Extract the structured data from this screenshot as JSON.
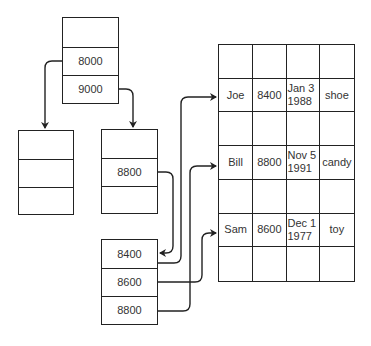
{
  "diagram": {
    "root_node": {
      "cells": [
        "",
        "8000",
        "9000"
      ]
    },
    "left_child": {
      "cells": [
        "",
        "",
        ""
      ]
    },
    "right_child": {
      "cells": [
        "",
        "8800",
        ""
      ]
    },
    "leaf_node": {
      "cells": [
        "8400",
        "8600",
        "8800"
      ]
    },
    "table": {
      "rows": [
        [
          "",
          "",
          "",
          ""
        ],
        [
          "Joe",
          "8400",
          "Jan 3\n1988",
          "shoe"
        ],
        [
          "",
          "",
          "",
          ""
        ],
        [
          "Bill",
          "8800",
          "Nov 5\n1991",
          "candy"
        ],
        [
          "",
          "",
          "",
          ""
        ],
        [
          "Sam",
          "8600",
          "Dec 1\n1977",
          "toy"
        ],
        [
          "",
          "",
          "",
          ""
        ]
      ]
    },
    "edges": [
      {
        "from": "root_node.8000",
        "to": "left_child"
      },
      {
        "from": "root_node.9000",
        "to": "right_child"
      },
      {
        "from": "right_child.8800",
        "to": "leaf_node.8400"
      },
      {
        "from": "leaf_node.8400",
        "to": "table.row.Joe"
      },
      {
        "from": "leaf_node.8600",
        "to": "table.row.Sam"
      },
      {
        "from": "leaf_node.8800",
        "to": "table.row.Bill"
      }
    ],
    "colors": {
      "stroke": "#222222",
      "text": "#333333",
      "background": "#ffffff"
    }
  }
}
